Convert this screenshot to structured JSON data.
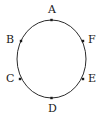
{
  "figure": {
    "type": "geometry-diagram",
    "width": 103,
    "height": 120,
    "background_color": "#ffffff",
    "stroke_color": "#2b2b2b",
    "point_color": "#1a1a1a",
    "label_color": "#1a1a1a",
    "circle": {
      "center_x": 51.5,
      "center_y": 59,
      "radius_x": 34.5,
      "radius_y": 39,
      "stroke_width": 1
    },
    "points": [
      {
        "id": "A",
        "label": "A",
        "px": 51.5,
        "py": 20,
        "label_x": 48,
        "label_y": 4
      },
      {
        "id": "B",
        "label": "B",
        "px": 21,
        "py": 41,
        "label_x": 6,
        "label_y": 34
      },
      {
        "id": "C",
        "label": "C",
        "px": 20,
        "py": 79,
        "label_x": 6,
        "label_y": 73
      },
      {
        "id": "D",
        "label": "D",
        "px": 51.5,
        "py": 98,
        "label_x": 48,
        "label_y": 103
      },
      {
        "id": "E",
        "label": "E",
        "px": 83,
        "py": 79,
        "label_x": 88,
        "label_y": 73
      },
      {
        "id": "F",
        "label": "F",
        "px": 83,
        "py": 41,
        "label_x": 88,
        "label_y": 34
      }
    ]
  }
}
